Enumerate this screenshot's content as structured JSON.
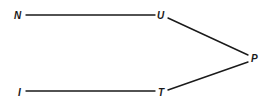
{
  "diagram": {
    "type": "graph",
    "nodes": [
      {
        "id": "N",
        "label": "N",
        "x": 18,
        "y": 15
      },
      {
        "id": "U",
        "label": "U",
        "x": 162,
        "y": 15
      },
      {
        "id": "P",
        "label": "P",
        "x": 254,
        "y": 58
      },
      {
        "id": "I",
        "label": "I",
        "x": 21,
        "y": 92
      },
      {
        "id": "T",
        "label": "T",
        "x": 162,
        "y": 92
      }
    ],
    "edges": [
      {
        "from": "N",
        "to": "U"
      },
      {
        "from": "U",
        "to": "P"
      },
      {
        "from": "P",
        "to": "T"
      },
      {
        "from": "T",
        "to": "I"
      }
    ],
    "colors": {
      "line": "#1a1a1a",
      "background": "#ffffff"
    }
  }
}
